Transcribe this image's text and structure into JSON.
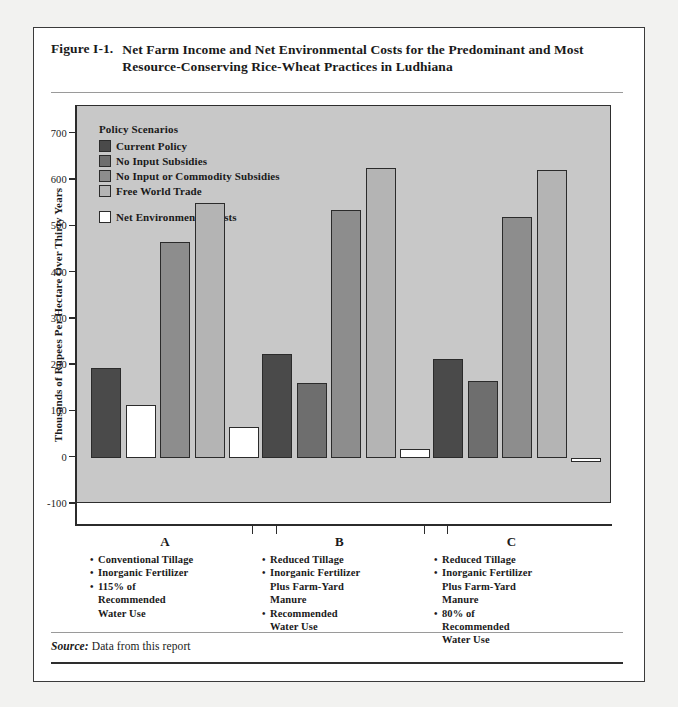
{
  "figure": {
    "number": "Figure I-1.",
    "title_line1": "Net Farm Income and Net Environmental Costs for the Predominant and Most",
    "title_line2": "Resource-Conserving Rice-Wheat Practices in Ludhiana"
  },
  "source": {
    "label": "Source:",
    "text": " Data from this report"
  },
  "legend": {
    "title": "Policy Scenarios",
    "items": [
      {
        "label": "Current Policy",
        "color": "#4a4a4a"
      },
      {
        "label": "No Input Subsidies",
        "color": "#6e6e6e"
      },
      {
        "label": "No Input or Commodity Subsidies",
        "color": "#8d8d8d"
      },
      {
        "label": "Free World Trade",
        "color": "#b4b4b4"
      }
    ],
    "extra": [
      {
        "label": "Net Environmental Costs",
        "color": "#ffffff"
      }
    ]
  },
  "chart_data": {
    "type": "bar",
    "title": "Net Farm Income and Net Environmental Costs for the Predominant and Most Resource-Conserving Rice-Wheat Practices in Ludhiana",
    "xlabel": "",
    "ylabel": "Thousands of Rupees Per Hectare Over Thirty Years",
    "ylim": [
      -100,
      700
    ],
    "yticks": [
      -100,
      0,
      100,
      200,
      300,
      400,
      500,
      600,
      700
    ],
    "ytick_labels": [
      "-100",
      "0",
      "100",
      "200",
      "300",
      "400",
      "500",
      "600",
      "700"
    ],
    "grid": false,
    "legend_position": "top-left inside plot",
    "categories": [
      "A",
      "B",
      "C"
    ],
    "series": [
      {
        "name": "Current Policy",
        "color": "#4a4a4a",
        "values": [
          193,
          225,
          213
        ]
      },
      {
        "name": "Net Environmental Costs",
        "color": "#ffffff",
        "values": [
          115,
          0,
          0
        ]
      },
      {
        "name": "No Input Subsidies",
        "color": "#6e6e6e",
        "values": [
          0,
          162,
          166
        ]
      },
      {
        "name": "No Input or Commodity Subsidies",
        "color": "#8d8d8d",
        "values": [
          466,
          535,
          521
        ]
      },
      {
        "name": "Free World Trade",
        "color": "#b4b4b4",
        "values": [
          551,
          627,
          622
        ]
      },
      {
        "name": "Net Environmental Costs (trade)",
        "color": "#ffffff",
        "values": [
          66,
          18,
          -10
        ]
      }
    ],
    "bars": [
      {
        "group": "A",
        "series": "Current Policy",
        "value": 193,
        "color": "#4a4a4a"
      },
      {
        "group": "A",
        "series": "Net Environmental Costs",
        "value": 115,
        "color": "#ffffff"
      },
      {
        "group": "A",
        "series": "No Input or Commodity Subsidies",
        "value": 466,
        "color": "#8d8d8d"
      },
      {
        "group": "A",
        "series": "Free World Trade",
        "value": 551,
        "color": "#b4b4b4"
      },
      {
        "group": "A",
        "series": "Net Environmental Costs",
        "value": 66,
        "color": "#ffffff"
      },
      {
        "group": "B",
        "series": "Current Policy",
        "value": 225,
        "color": "#4a4a4a"
      },
      {
        "group": "B",
        "series": "No Input Subsidies",
        "value": 162,
        "color": "#6e6e6e"
      },
      {
        "group": "B",
        "series": "No Input or Commodity Subsidies",
        "value": 535,
        "color": "#8d8d8d"
      },
      {
        "group": "B",
        "series": "Free World Trade",
        "value": 627,
        "color": "#b4b4b4"
      },
      {
        "group": "B",
        "series": "Net Environmental Costs",
        "value": 18,
        "color": "#ffffff"
      },
      {
        "group": "C",
        "series": "Current Policy",
        "value": 213,
        "color": "#4a4a4a"
      },
      {
        "group": "C",
        "series": "No Input Subsidies",
        "value": 166,
        "color": "#6e6e6e"
      },
      {
        "group": "C",
        "series": "No Input or Commodity Subsidies",
        "value": 521,
        "color": "#8d8d8d"
      },
      {
        "group": "C",
        "series": "Free World Trade",
        "value": 622,
        "color": "#b4b4b4"
      },
      {
        "group": "C",
        "series": "Net Environmental Costs",
        "value": -10,
        "color": "#ffffff"
      }
    ]
  },
  "groups": [
    {
      "letter": "A",
      "bullets": [
        [
          "Conventional Tillage"
        ],
        [
          "Inorganic Fertilizer"
        ],
        [
          "115% of",
          "Recommended",
          "Water Use"
        ]
      ]
    },
    {
      "letter": "B",
      "bullets": [
        [
          "Reduced Tillage"
        ],
        [
          "Inorganic Fertilizer",
          "Plus Farm-Yard",
          "Manure"
        ],
        [
          "Recommended",
          "Water Use"
        ]
      ]
    },
    {
      "letter": "C",
      "bullets": [
        [
          "Reduced Tillage"
        ],
        [
          "Inorganic Fertilizer",
          "Plus Farm-Yard",
          "Manure"
        ],
        [
          "80% of",
          "Recommended",
          "Water Use"
        ]
      ]
    }
  ],
  "colors": {
    "plot_background": "#c8c8c8",
    "frame": "#2e2e2e",
    "page": "#ffffff"
  }
}
